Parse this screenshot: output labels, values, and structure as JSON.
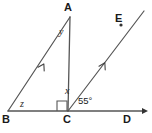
{
  "figure": {
    "type": "geometry-diagram",
    "background_color": "#ffffff",
    "stroke_color": "#555555",
    "text_color": "#1a1a1a"
  },
  "vertices": {
    "A": {
      "label": "A",
      "x": 70,
      "y": 17
    },
    "B": {
      "label": "B",
      "x": 8,
      "y": 111
    },
    "C": {
      "label": "C",
      "x": 68,
      "y": 111
    },
    "D": {
      "label": "D",
      "x": 128,
      "y": 111
    },
    "E": {
      "label": "E",
      "x": 120,
      "y": 25
    }
  },
  "angles": {
    "x": {
      "label": "x",
      "at": "C",
      "between": "CA and CE"
    },
    "y": {
      "label": "y",
      "at": "A",
      "between": "AB and AC"
    },
    "z": {
      "label": "z",
      "at": "B",
      "between": "BA and BC"
    },
    "given": {
      "label": "55°",
      "value": 55,
      "at": "C",
      "between": "CE and CD"
    },
    "right_angle": {
      "label": "",
      "at": "C",
      "value": 90,
      "between": "BC and CA"
    }
  },
  "segments": [
    {
      "name": "BA",
      "from": "B",
      "to": "A",
      "marks": 1
    },
    {
      "name": "AC",
      "from": "A",
      "to": "C",
      "marks": 0
    },
    {
      "name": "BD",
      "from": "B",
      "to": "D",
      "marks": 0,
      "arrow_end": true
    },
    {
      "name": "CE",
      "from": "C",
      "to": "E",
      "marks": 1,
      "arrow_end": true
    }
  ],
  "parallel_marks": {
    "count": 1,
    "on": [
      "BA",
      "CE"
    ]
  }
}
